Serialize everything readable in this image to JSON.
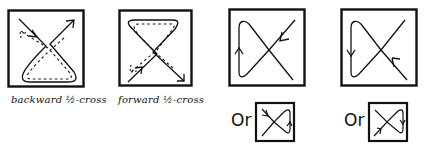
{
  "figure": {
    "colors": {
      "ink": "#111111",
      "background": "#ffffff"
    },
    "panels": [
      {
        "id": "backward-half-cross",
        "caption": "backward ½-cross",
        "description": "Solid path enters top-left with arrow, crosses center, loops around bottom and exits top-right with arrow; dotted path traces reverse loop"
      },
      {
        "id": "forward-half-cross",
        "caption": "forward ½-cross",
        "description": "Solid path from bottom-left with arrow crosses center to bottom-right arrow, loop at top; dotted path traces reverse"
      },
      {
        "id": "cross-loop-up",
        "caption": "",
        "description": "X-shaped crossing with loop on left; arrow pointing inward at top-right and upward arrow on left loop"
      },
      {
        "id": "cross-loop-down",
        "caption": "",
        "description": "X-shaped crossing with loop on left; arrow pointing inward at bottom-right and downward arrow on left loop"
      }
    ],
    "alternatives": [
      {
        "prefix": "Or",
        "description": "Mirrored small variant: loop on right with upward arrow, arrow entering at top-left"
      },
      {
        "prefix": "Or",
        "description": "Mirrored small variant: loop on right with downward arrow, arrow entering at bottom-left"
      }
    ]
  }
}
